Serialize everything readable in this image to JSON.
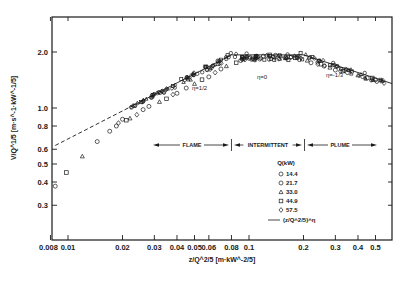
{
  "chart_data": {
    "type": "scatter",
    "title": "",
    "xlabel": "z/Q^2/5 [m·kW^-2/5]",
    "ylabel": "V/Q^1/5 [m·s^-1·kW^-1/5]",
    "xscale": "log",
    "yscale": "log",
    "xlim": [
      0.008,
      0.6
    ],
    "ylim": [
      0.22,
      2.6
    ],
    "x_ticks": [
      0.008,
      0.01,
      0.02,
      0.03,
      0.04,
      0.05,
      0.06,
      0.08,
      0.1,
      0.2,
      0.3,
      0.4,
      0.5
    ],
    "x_tick_labels": [
      "0.008",
      "0.01",
      "0.02",
      "0.03",
      "0.04",
      "0.05",
      "0.06",
      "0.08",
      "0.1",
      "0.2",
      "0.3",
      "0.4",
      "0.5"
    ],
    "y_ticks": [
      0.3,
      0.4,
      0.5,
      0.6,
      0.8,
      1.0,
      2.0
    ],
    "y_tick_labels": [
      "0.3",
      "0.4",
      "0.5",
      "0.6",
      "0.8",
      "1.0",
      "2.0"
    ],
    "grid": false,
    "legend": {
      "title": "Q(kW)",
      "position": "lower right",
      "entries": [
        {
          "marker": "circle",
          "label": "14.4"
        },
        {
          "marker": "octagon",
          "label": "21.7"
        },
        {
          "marker": "triangle",
          "label": "33.0"
        },
        {
          "marker": "square",
          "label": "44.9"
        },
        {
          "marker": "diamond",
          "label": "57.5"
        },
        {
          "marker": "line",
          "label": "(z/Q^2/5)^η"
        }
      ]
    },
    "regions": [
      {
        "label": "FLAME",
        "x_range": [
          0.03,
          0.08
        ]
      },
      {
        "label": "INTERMITTENT",
        "x_range": [
          0.08,
          0.2
        ]
      },
      {
        "label": "PLUME",
        "x_range": [
          0.2,
          0.5
        ]
      }
    ],
    "annotations": [
      {
        "text": "η=1/2",
        "x": 0.05,
        "y": 1.25
      },
      {
        "text": "η=0",
        "x": 0.12,
        "y": 1.65
      },
      {
        "text": "η=-1/3",
        "x": 0.3,
        "y": 1.4
      }
    ],
    "fit_lines": [
      {
        "eta": "1/2",
        "x": [
          0.008,
          0.08
        ],
        "y": [
          0.61,
          1.93
        ],
        "style": "dashed below 0.025, solid above"
      },
      {
        "eta": "0",
        "x": [
          0.08,
          0.2
        ],
        "y": [
          1.93,
          1.93
        ],
        "style": "solid"
      },
      {
        "eta": "-1/3",
        "x": [
          0.2,
          0.58
        ],
        "y": [
          1.93,
          1.36
        ],
        "style": "solid"
      }
    ],
    "series": [
      {
        "name": "14.4",
        "marker": "circle",
        "points": [
          [
            0.0085,
            0.38
          ],
          [
            0.0145,
            0.66
          ],
          [
            0.017,
            0.75
          ],
          [
            0.026,
            0.98
          ],
          [
            0.04,
            1.2
          ],
          [
            0.06,
            1.47
          ],
          [
            0.09,
            1.8
          ],
          [
            0.12,
            1.9
          ],
          [
            0.16,
            1.88
          ],
          [
            0.22,
            1.75
          ],
          [
            0.3,
            1.6
          ],
          [
            0.45,
            1.45
          ]
        ]
      },
      {
        "name": "21.7",
        "marker": "octagon",
        "points": [
          [
            0.0185,
            0.8
          ],
          [
            0.02,
            0.87
          ],
          [
            0.028,
            1.02
          ],
          [
            0.045,
            1.28
          ],
          [
            0.07,
            1.62
          ],
          [
            0.1,
            1.85
          ],
          [
            0.14,
            1.92
          ],
          [
            0.19,
            1.82
          ],
          [
            0.26,
            1.68
          ],
          [
            0.35,
            1.55
          ],
          [
            0.5,
            1.42
          ]
        ]
      },
      {
        "name": "33.0",
        "marker": "triangle",
        "points": [
          [
            0.012,
            0.55
          ],
          [
            0.022,
            0.88
          ],
          [
            0.032,
            1.08
          ],
          [
            0.05,
            1.35
          ],
          [
            0.075,
            1.68
          ],
          [
            0.11,
            1.88
          ],
          [
            0.15,
            1.9
          ],
          [
            0.21,
            1.8
          ],
          [
            0.28,
            1.65
          ],
          [
            0.4,
            1.5
          ]
        ]
      },
      {
        "name": "44.9",
        "marker": "square",
        "points": [
          [
            0.0098,
            0.45
          ],
          [
            0.021,
            0.86
          ],
          [
            0.035,
            1.12
          ],
          [
            0.055,
            1.42
          ],
          [
            0.085,
            1.75
          ],
          [
            0.13,
            1.93
          ],
          [
            0.18,
            1.86
          ],
          [
            0.25,
            1.72
          ],
          [
            0.33,
            1.58
          ],
          [
            0.48,
            1.45
          ]
        ]
      },
      {
        "name": "57.5",
        "marker": "diamond",
        "points": [
          [
            0.019,
            0.83
          ],
          [
            0.024,
            0.92
          ],
          [
            0.038,
            1.18
          ],
          [
            0.065,
            1.55
          ],
          [
            0.095,
            1.82
          ],
          [
            0.125,
            1.91
          ],
          [
            0.17,
            1.87
          ],
          [
            0.24,
            1.72
          ],
          [
            0.32,
            1.58
          ],
          [
            0.55,
            1.4
          ]
        ]
      }
    ]
  }
}
